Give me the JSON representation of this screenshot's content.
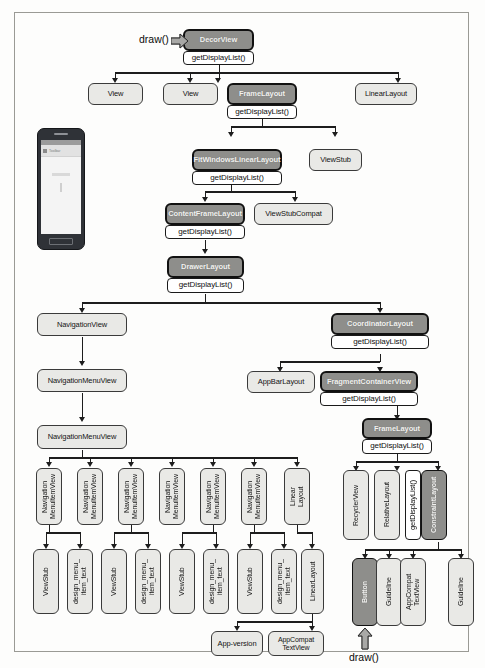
{
  "callouts": {
    "draw_top": "draw()",
    "draw_bottom": "draw()"
  },
  "phone": {
    "app_title": "Toolbar"
  },
  "colors": {
    "node_fill": "#e9e9e6",
    "node_highlight_fill": "#8e8e8b",
    "node_border": "#3a3a3a",
    "sub_fill": "#ffffff",
    "connector": "#1d1d1d",
    "frame_border": "#9a9a95",
    "page_background": "#fdfdfc"
  },
  "nodes": {
    "decorview": {
      "label": "DecorView",
      "sub": "getDisplayList()",
      "highlighted": true
    },
    "row1": [
      {
        "label": "View",
        "highlighted": false
      },
      {
        "label": "View",
        "highlighted": false
      },
      {
        "label": "FrameLayout",
        "sub": "getDisplayList()",
        "highlighted": true
      },
      {
        "label": "LinearLayout",
        "highlighted": false
      }
    ],
    "row2": [
      {
        "label": "FitWindowsLinearLayout",
        "sub": "getDisplayList()",
        "highlighted": true
      },
      {
        "label": "ViewStub",
        "highlighted": false
      }
    ],
    "row3": [
      {
        "label": "ContentFrameLayout",
        "sub": "getDisplayList()",
        "highlighted": true
      },
      {
        "label": "ViewStubCompat",
        "highlighted": false
      }
    ],
    "row4": [
      {
        "label": "DrawerLayout",
        "sub": "getDisplayList()",
        "highlighted": true
      }
    ],
    "left": {
      "navigationview": "NavigationView",
      "navigationmenuview1": "NavigationMenuView",
      "navigationmenuview2": "NavigationMenuView",
      "item_row": [
        {
          "label": "Navigation\nMenuItemView"
        },
        {
          "label": "Navigation\nMenuItemView"
        },
        {
          "label": "Navigation\nMenuItemView"
        },
        {
          "label": "Navigation\nMenuItemView"
        },
        {
          "label": "Navigation\nMenuItemView"
        },
        {
          "label": "Navigation\nMenuItemView"
        },
        {
          "label": "Linear\nLayout"
        }
      ],
      "leaf_row": [
        {
          "label": "ViewStub"
        },
        {
          "label": "design_menu_\nitem_text"
        },
        {
          "label": "ViewStub"
        },
        {
          "label": "design_menu_\nitem_text"
        },
        {
          "label": "ViewStub"
        },
        {
          "label": "design_menu_\nitem_text"
        },
        {
          "label": "ViewStub"
        },
        {
          "label": "design_menu_\nitem_text"
        },
        {
          "label": "LinearLayout"
        }
      ],
      "final_row": [
        {
          "label": "App-version"
        },
        {
          "label": "AppCompat\nTextView"
        }
      ]
    },
    "right": {
      "coordinatorlayout": {
        "label": "CoordinatorLayout",
        "sub": "getDisplayList()",
        "highlighted": true
      },
      "appbarlayout": "AppBarLayout",
      "fragmentcontainerview": {
        "label": "FragmentContainerView",
        "sub": "getDisplayList()",
        "highlighted": true
      },
      "framelayout": {
        "label": "FrameLayout",
        "sub": "getDisplayList()",
        "highlighted": true
      },
      "children": [
        {
          "label": "RecyclerView"
        },
        {
          "label": "RelativeLayout"
        }
      ],
      "constraintlayout": {
        "label": "ConstraintLayout",
        "sub": "getDisplayList()",
        "highlighted": true
      },
      "constraint_children": [
        {
          "label": "Button",
          "highlighted": true
        },
        {
          "label": "Guideline"
        },
        {
          "label": "AppCompat\nTextView"
        },
        {
          "label": "Guideline"
        }
      ]
    }
  }
}
